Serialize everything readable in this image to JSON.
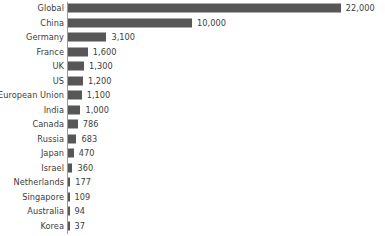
{
  "chart_data": {
    "type": "bar",
    "orientation": "horizontal",
    "title": "",
    "subtitle": "",
    "xlabel": "",
    "ylabel": "",
    "grid": false,
    "legend": false,
    "axis_ticks": [],
    "bar_color": "#575757",
    "text_color": "#3d3d3d",
    "axis_color": "#9a9a9a",
    "xlim": [
      0,
      22000
    ],
    "categories": [
      "Global",
      "China",
      "Germany",
      "France",
      "UK",
      "US",
      "European Union",
      "India",
      "Canada",
      "Russia",
      "Japan",
      "Israel",
      "Netherlands",
      "Singapore",
      "Australia",
      "Korea"
    ],
    "values": [
      22000,
      10000,
      3100,
      1600,
      1300,
      1200,
      1100,
      1000,
      786,
      683,
      470,
      360,
      177,
      109,
      94,
      37
    ],
    "value_labels": [
      "22,000",
      "10,000",
      "3,100",
      "1,600",
      "1,300",
      "1,200",
      "1,100",
      "1,000",
      "786",
      "683",
      "470",
      "360",
      "177",
      "109",
      "94",
      "37"
    ]
  },
  "layout": {
    "axis_x_px": 68,
    "row_pitch_px": 14.5,
    "row_top_px": 1,
    "bar_height_px": 9,
    "px_per_unit": 0.0124,
    "min_bar_px": 1.5,
    "label_gap_px": 5
  }
}
